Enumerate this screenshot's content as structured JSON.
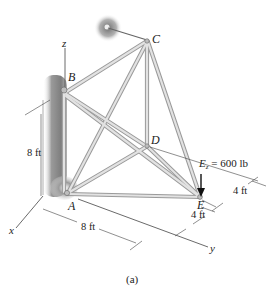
{
  "figure": {
    "caption": "(a)",
    "points": {
      "A": "A",
      "B": "B",
      "C": "C",
      "D": "D",
      "E": "E"
    },
    "axes": {
      "x": "x",
      "y": "y",
      "z": "z"
    },
    "load": {
      "symbol": "E",
      "subscript": "z",
      "value_text": " = 600 lb",
      "magnitude": 600,
      "unit": "lb"
    },
    "dimensions": {
      "vertical_AB": "8 ft",
      "horizontal_AE": "8 ft",
      "e_to_d_side": "4 ft",
      "e_lower": "4 ft"
    },
    "members": [
      "AB",
      "BC",
      "BE",
      "BD",
      "AC",
      "AD",
      "AE",
      "CD",
      "CE",
      "DE"
    ],
    "supports": [
      "wall at A and B (left)",
      "ball-and-socket at C (top)"
    ],
    "colors": {
      "member_fill": "#d8d8d8",
      "member_edge": "#9a9a9a",
      "wall_shade": "#8c8c8c",
      "line": "#333333"
    }
  }
}
